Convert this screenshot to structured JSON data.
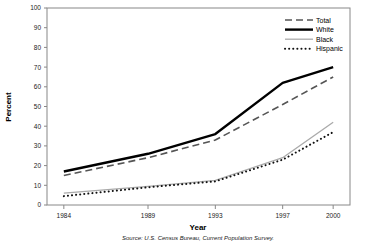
{
  "chart_data": {
    "type": "line",
    "title": "",
    "xlabel": "Year",
    "ylabel": "Percent",
    "categories": [
      "1984",
      "1989",
      "1993",
      "1997",
      "2000"
    ],
    "x": [
      1984,
      1989,
      1993,
      1997,
      2000
    ],
    "xlim": [
      1983,
      2001
    ],
    "ylim": [
      0,
      100
    ],
    "ytick_step": 10,
    "yticks": [
      "0",
      "10",
      "20",
      "30",
      "40",
      "50",
      "60",
      "70",
      "80",
      "90",
      "100"
    ],
    "grid": false,
    "legend_position": "top-right",
    "series": [
      {
        "name": "Total",
        "values": [
          15,
          24,
          33,
          51,
          65
        ],
        "style": "dashed",
        "color": "#555555",
        "width": 1.6
      },
      {
        "name": "White",
        "values": [
          17,
          26,
          36,
          62,
          70
        ],
        "style": "solid",
        "color": "#000000",
        "width": 2.4
      },
      {
        "name": "Black",
        "values": [
          6,
          9.5,
          12.5,
          24,
          42
        ],
        "style": "solid",
        "color": "#aaaaaa",
        "width": 1.3
      },
      {
        "name": "Hispanic",
        "values": [
          4.5,
          9,
          12,
          23,
          37
        ],
        "style": "dotted",
        "color": "#111111",
        "width": 2.0
      }
    ],
    "annotations": {
      "source": "Source: U.S. Census Bureau, Current Population Survey."
    }
  },
  "legend": {
    "items": [
      {
        "label": "Total"
      },
      {
        "label": "White"
      },
      {
        "label": "Black"
      },
      {
        "label": "Hispanic"
      }
    ]
  },
  "axes": {
    "y_title": "Percent",
    "x_title": "Year"
  },
  "footer": {
    "source": "Source: U.S. Census Bureau, Current Population Survey."
  }
}
